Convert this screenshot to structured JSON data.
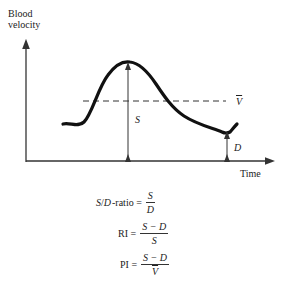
{
  "diagram": {
    "y_axis_label_line1": "Blood",
    "y_axis_label_line2": "velocity",
    "x_axis_label": "Time",
    "mean_velocity_label": "V",
    "systolic_label": "S",
    "diastolic_label": "D"
  },
  "equations": {
    "sd_ratio": {
      "lhs_s": "S",
      "lhs_slash": "/",
      "lhs_d": "D",
      "lhs_rest": "-ratio =",
      "num": "S",
      "den": "D"
    },
    "ri": {
      "lhs": "RI =",
      "num": "S − D",
      "den": "S"
    },
    "pi": {
      "lhs": "PI =",
      "num": "S − D",
      "den": "V"
    }
  },
  "colors": {
    "curve": "#111111",
    "axis": "#333333"
  }
}
